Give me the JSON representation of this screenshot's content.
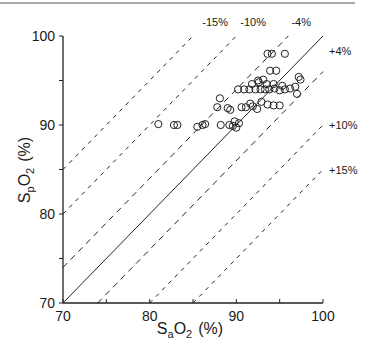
{
  "chart_data": {
    "type": "scatter",
    "title": "",
    "xlabel": "SaO2 (%)",
    "ylabel": "SpO2 (%)",
    "xlabel_parts": {
      "main": "S",
      "sub": "a",
      "rest": "O",
      "sub2": "2",
      "unit": "(%)"
    },
    "ylabel_parts": {
      "main": "S",
      "sub": "p",
      "rest": "O",
      "sub2": "2",
      "unit": "(%)"
    },
    "xlim": [
      70,
      100
    ],
    "ylim": [
      70,
      100
    ],
    "x_ticks": [
      70,
      80,
      90,
      100
    ],
    "y_ticks": [
      70,
      80,
      90,
      100
    ],
    "x_tick_labels": [
      "70",
      "80",
      "90",
      "100"
    ],
    "y_tick_labels": [
      "70",
      "80",
      "90",
      "100"
    ],
    "grid": false,
    "legend": null,
    "reference_lines": [
      {
        "label": "",
        "offset": 0,
        "style": "solid"
      },
      {
        "label": "-15%",
        "offset": 15,
        "style": "dashed"
      },
      {
        "label": "-10%",
        "offset": 10,
        "style": "dashed"
      },
      {
        "label": "-4%",
        "offset": 4,
        "style": "dashed"
      },
      {
        "label": "+4%",
        "offset": -4,
        "style": "dashed"
      },
      {
        "label": "+10%",
        "offset": -10,
        "style": "dashed"
      },
      {
        "label": "+15%",
        "offset": -15,
        "style": "dashed"
      }
    ],
    "series": [
      {
        "name": "measurements",
        "marker": "open-circle",
        "points": [
          [
            93.6,
            98.0
          ],
          [
            94.1,
            98.0
          ],
          [
            95.6,
            98.0
          ],
          [
            93.9,
            96.1
          ],
          [
            94.6,
            96.1
          ],
          [
            97.2,
            95.4
          ],
          [
            97.4,
            95.1
          ],
          [
            92.5,
            95.0
          ],
          [
            93.1,
            95.1
          ],
          [
            91.8,
            94.6
          ],
          [
            92.6,
            94.8
          ],
          [
            93.5,
            94.6
          ],
          [
            94.3,
            94.6
          ],
          [
            95.3,
            94.4
          ],
          [
            96.2,
            94.1
          ],
          [
            96.8,
            94.3
          ],
          [
            90.2,
            94.0
          ],
          [
            90.9,
            94.0
          ],
          [
            91.5,
            94.0
          ],
          [
            92.2,
            94.0
          ],
          [
            92.8,
            94.0
          ],
          [
            93.3,
            94.0
          ],
          [
            93.8,
            94.0
          ],
          [
            94.4,
            94.1
          ],
          [
            95.0,
            93.9
          ],
          [
            95.6,
            94.0
          ],
          [
            97.0,
            93.5
          ],
          [
            88.1,
            93.0
          ],
          [
            91.6,
            92.4
          ],
          [
            93.6,
            92.3
          ],
          [
            94.3,
            92.2
          ],
          [
            95.0,
            92.2
          ],
          [
            87.8,
            92.0
          ],
          [
            89.0,
            91.9
          ],
          [
            89.3,
            91.7
          ],
          [
            90.6,
            92.0
          ],
          [
            91.1,
            92.0
          ],
          [
            91.9,
            92.1
          ],
          [
            92.4,
            91.8
          ],
          [
            92.9,
            92.6
          ],
          [
            81.0,
            90.1
          ],
          [
            82.8,
            90.0
          ],
          [
            83.2,
            90.0
          ],
          [
            85.5,
            89.8
          ],
          [
            86.1,
            90.0
          ],
          [
            86.4,
            90.1
          ],
          [
            88.2,
            90.0
          ],
          [
            89.2,
            90.0
          ],
          [
            89.8,
            90.4
          ],
          [
            90.0,
            89.7
          ],
          [
            90.3,
            90.2
          ],
          [
            89.6,
            89.9
          ]
        ]
      }
    ]
  }
}
